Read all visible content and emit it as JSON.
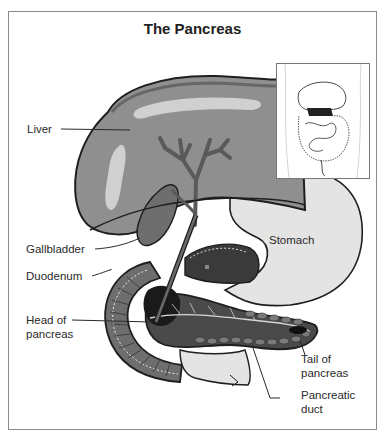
{
  "diagram": {
    "title": "The Pancreas",
    "labels": {
      "liver": "Liver",
      "gallbladder": "Gallbladder",
      "duodenum": "Duodenum",
      "head_of_pancreas_1": "Head of",
      "head_of_pancreas_2": "pancreas",
      "stomach": "Stomach",
      "tail_of_pancreas_1": "Tail of",
      "tail_of_pancreas_2": "pancreas",
      "pancreatic_duct_1": "Pancreatic",
      "pancreatic_duct_2": "duct"
    },
    "inset": "torso-location-inset",
    "colors": {
      "liver": "#8f8f8f",
      "liver_highlight": "#cfcfcf",
      "stomach": "#e4e4e4",
      "pancreas": "#4a4a4a",
      "duodenum": "#6e6e6e",
      "outline": "#1e1e1e",
      "frame": "#8a8a8a"
    }
  }
}
